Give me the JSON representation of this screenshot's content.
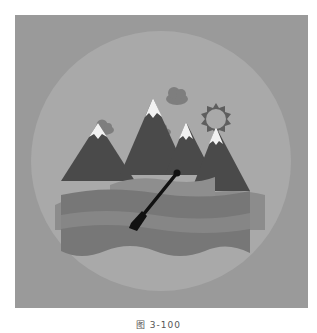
{
  "figure": {
    "caption": "图 3-100",
    "colors": {
      "background": "#9a9a9a",
      "circle": "#a9a9a9",
      "mountain_dark": "#4a4a4a",
      "mountain_shade": "#5a5a5a",
      "snow": "#f2f2f2",
      "cloud": "#7e7e7e",
      "sun": "#5e5e5e",
      "water_back": "#8c8c8c",
      "water_front": "#777777",
      "water_band": "#868686",
      "paddle": "#111111"
    },
    "icons": [
      "mountain-icon",
      "cloud-icon",
      "sun-icon",
      "paddle-icon",
      "water-wave-icon"
    ]
  }
}
